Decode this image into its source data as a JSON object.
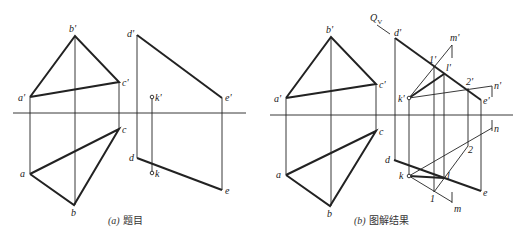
{
  "panels": [
    {
      "id": "a",
      "caption_letter": "(a)",
      "caption_text": "题目",
      "labels": {
        "a_prime": "a'",
        "b_prime": "b'",
        "c_prime": "c'",
        "a": "a",
        "b": "b",
        "c": "c",
        "d_prime": "d'",
        "e_prime": "e'",
        "d": "d",
        "e": "e",
        "k_prime": "k'",
        "k": "k"
      }
    },
    {
      "id": "b",
      "caption_letter": "(b)",
      "caption_text": "图解结果",
      "labels": {
        "a_prime": "a'",
        "b_prime": "b'",
        "c_prime": "c'",
        "a": "a",
        "b": "b",
        "c": "c",
        "d_prime": "d'",
        "e_prime": "e'",
        "d": "d",
        "e": "e",
        "k_prime": "k'",
        "k": "k",
        "m_prime": "m'",
        "n_prime": "n'",
        "m": "m",
        "n": "n",
        "one_prime": "1'",
        "two_prime": "2'",
        "l_prime": "l'",
        "one": "1",
        "two": "2",
        "l": "l",
        "qv": "Q",
        "qv_sub": "V"
      }
    }
  ],
  "colors": {
    "line": "#222222",
    "background": "#ffffff"
  }
}
